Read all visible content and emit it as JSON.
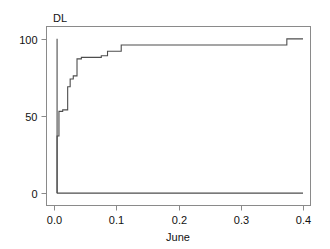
{
  "chart_data": {
    "type": "line",
    "title": "",
    "panel_label": "DL",
    "xlabel": "June",
    "ylabel": "",
    "xlim": [
      -0.012,
      0.412
    ],
    "ylim": [
      -8,
      108
    ],
    "xticks": [
      0.0,
      0.1,
      0.2,
      0.3,
      0.4
    ],
    "xticklabels": [
      "0.0",
      "0.1",
      "0.2",
      "0.3",
      "0.4"
    ],
    "yticks": [
      0,
      50,
      100
    ],
    "yticklabels": [
      "0",
      "50",
      "100"
    ],
    "grid": false,
    "legend": null,
    "line_color": "#4d4d4d",
    "frame_color": "#808080",
    "series": [
      {
        "name": "cumulative-step-curve",
        "step": "post",
        "x": [
          0.005,
          0.005,
          0.008,
          0.008,
          0.014,
          0.014,
          0.022,
          0.022,
          0.026,
          0.026,
          0.031,
          0.031,
          0.037,
          0.037,
          0.044,
          0.044,
          0.076,
          0.076,
          0.086,
          0.086,
          0.108,
          0.108,
          0.374,
          0.374,
          0.4
        ],
        "y": [
          0,
          37,
          37,
          53,
          53,
          54,
          54,
          69,
          69,
          74,
          74,
          76,
          76,
          87,
          87,
          88,
          88,
          89,
          89,
          92,
          92,
          96,
          96,
          100,
          100
        ]
      },
      {
        "name": "vertical-spike",
        "x": [
          0.005,
          0.005
        ],
        "y": [
          0,
          100
        ]
      },
      {
        "name": "baseline",
        "x": [
          0.005,
          0.4
        ],
        "y": [
          0,
          0
        ]
      }
    ],
    "annotations": []
  }
}
